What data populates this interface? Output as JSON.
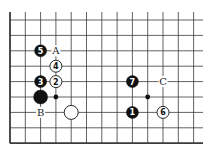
{
  "diagram": {
    "type": "go-board-fragment",
    "grid": {
      "x_lines": [
        10,
        25.3,
        40.6,
        55.9,
        71.2,
        86.5,
        101.8,
        117.1,
        132.4,
        147.7,
        163,
        178.3,
        193.6
      ],
      "y_lines": [
        20,
        35.4,
        50.8,
        66.2,
        81.6,
        97,
        112.4,
        127.8,
        143.2
      ],
      "left_edge_thick": true,
      "bottom_edge_thick": true,
      "line_color": "#3a3a3a"
    },
    "stones": [
      {
        "color": "black",
        "col": 2,
        "row": 2,
        "label": "5"
      },
      {
        "color": "white",
        "col": 3,
        "row": 3,
        "label": "4"
      },
      {
        "color": "black",
        "col": 2,
        "row": 4,
        "label": "3"
      },
      {
        "color": "white",
        "col": 3,
        "row": 4,
        "label": "2"
      },
      {
        "color": "black",
        "col": 2,
        "row": 5,
        "label": "",
        "large": true
      },
      {
        "color": "white",
        "col": 4,
        "row": 6,
        "label": "",
        "large": true
      },
      {
        "color": "black",
        "col": 8,
        "row": 4,
        "label": "7"
      },
      {
        "color": "black",
        "col": 8,
        "row": 6,
        "label": "1"
      },
      {
        "color": "white",
        "col": 10,
        "row": 6,
        "label": "6"
      }
    ],
    "markers": [
      {
        "type": "dot",
        "col": 3,
        "row": 5
      },
      {
        "type": "dot",
        "col": 9,
        "row": 5
      }
    ],
    "letters": [
      {
        "text": "A",
        "col": 3,
        "row": 2
      },
      {
        "text": "B",
        "col": 2,
        "row": 6
      },
      {
        "text": "C",
        "col": 10,
        "row": 4
      }
    ]
  }
}
